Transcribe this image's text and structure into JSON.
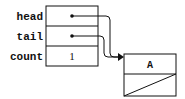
{
  "diagram": {
    "type": "linked-list",
    "header": {
      "fields": [
        {
          "label": "head",
          "value": "pointer"
        },
        {
          "label": "tail",
          "value": "pointer"
        },
        {
          "label": "count",
          "value": "1"
        }
      ]
    },
    "nodes": [
      {
        "data": "A",
        "next": "null"
      }
    ],
    "edges": [
      {
        "from": "head",
        "to": "node-A"
      },
      {
        "from": "tail",
        "to": "node-A"
      }
    ],
    "colors": {
      "stroke": "#111111",
      "background": "#ffffff"
    }
  }
}
